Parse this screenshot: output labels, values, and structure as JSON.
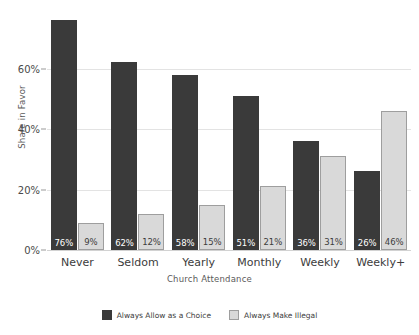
{
  "chart_data": {
    "type": "bar",
    "title": "",
    "xlabel": "Church Attendance",
    "ylabel": "Share in Favor",
    "categories": [
      "Never",
      "Seldom",
      "Yearly",
      "Monthly",
      "Weekly",
      "Weekly+"
    ],
    "series": [
      {
        "name": "Always Allow as a Choice",
        "color": "#3a3a3a",
        "values": [
          76,
          62,
          58,
          51,
          36,
          26
        ],
        "labels": [
          "76%",
          "62%",
          "58%",
          "51%",
          "36%",
          "26%"
        ]
      },
      {
        "name": "Always Make Illegal",
        "color": "#d9d9d9",
        "values": [
          9,
          12,
          15,
          21,
          31,
          46
        ],
        "labels": [
          "9%",
          "12%",
          "15%",
          "21%",
          "31%",
          "46%"
        ]
      }
    ],
    "ylim": [
      0,
      80
    ],
    "yticks": [
      0,
      20,
      40,
      60
    ],
    "yticklabels": [
      "0%",
      "20%",
      "40%",
      "60%"
    ],
    "grid": true,
    "legend_position": "bottom"
  },
  "colors": {
    "dark_series": "#3a3a3a",
    "light_series": "#d9d9d9",
    "light_series_border": "#9e9e9e",
    "gridline": "#e3e3e3",
    "axis": "#d2d2d2",
    "background": "#ffffff",
    "tick_text": "#4a4a4a",
    "axis_title_text": "#5a5a5a"
  }
}
